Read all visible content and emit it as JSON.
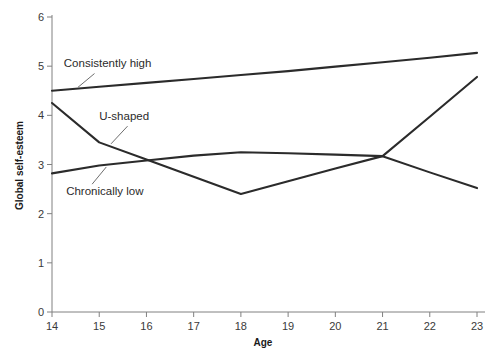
{
  "chart_data": {
    "type": "line",
    "title": "",
    "subtitle": "",
    "xlabel": "Age",
    "ylabel": "Global self-esteem",
    "x": [
      14,
      15,
      16,
      17,
      18,
      19,
      20,
      21,
      22,
      23
    ],
    "xticklabels": [
      "14",
      "15",
      "16",
      "17",
      "18",
      "19",
      "20",
      "21",
      "22",
      "23"
    ],
    "yticklabels": [
      "0",
      "1",
      "2",
      "3",
      "4",
      "5",
      "6"
    ],
    "yticks": [
      0,
      1,
      2,
      3,
      4,
      5,
      6
    ],
    "xlim": [
      14,
      23
    ],
    "ylim": [
      0,
      6
    ],
    "grid": false,
    "legend_position": "inline-annotations",
    "line_color": "#2b2b2b",
    "axis_color": "#808080",
    "series": [
      {
        "name": "Consistently high",
        "values": [
          4.5,
          4.58,
          4.66,
          4.74,
          4.82,
          4.9,
          4.99,
          5.08,
          5.17,
          5.27
        ],
        "label_x": 14.25,
        "label_y": 5.02
      },
      {
        "name": "U-shaped",
        "values": [
          4.25,
          3.45,
          3.1,
          2.75,
          2.4,
          2.66,
          2.92,
          3.17,
          3.97,
          4.78
        ],
        "label_x": 15.0,
        "label_y": 3.95
      },
      {
        "name": "Chronically low",
        "values": [
          2.82,
          2.98,
          3.08,
          3.18,
          3.25,
          3.23,
          3.2,
          3.17,
          2.84,
          2.52
        ],
        "label_x": 14.3,
        "label_y": 2.42
      }
    ],
    "annotations": [
      {
        "text": "Consistently high",
        "leader_from": [
          14.9,
          4.85
        ],
        "leader_to": [
          14.55,
          4.57
        ]
      },
      {
        "text": "U-shaped",
        "leader_from": [
          15.6,
          3.78
        ],
        "leader_to": [
          15.25,
          3.42
        ]
      },
      {
        "text": "Chronically low",
        "leader_from": [
          14.85,
          2.6
        ],
        "leader_to": [
          15.15,
          2.95
        ]
      }
    ]
  }
}
